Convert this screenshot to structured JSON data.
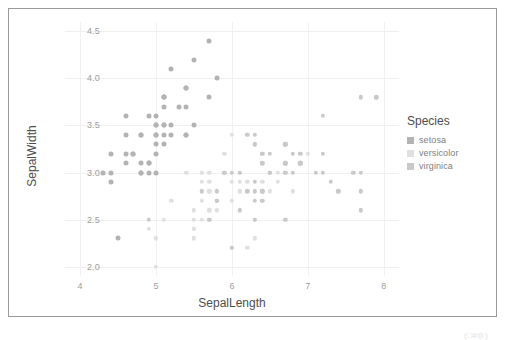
{
  "chart_data": {
    "type": "scatter",
    "title": "",
    "xlabel": "SepalLength",
    "ylabel": "SepalWidth",
    "xlim": [
      3.8,
      8.2
    ],
    "ylim": [
      1.9,
      4.6
    ],
    "xticks": [
      "4",
      "5",
      "6",
      "7",
      "8"
    ],
    "xtick_values": [
      4,
      5,
      6,
      7,
      8
    ],
    "yticks": [
      "2.0",
      "2.5",
      "3.0",
      "3.5",
      "4.0",
      "4.5"
    ],
    "ytick_values": [
      2.0,
      2.5,
      3.0,
      3.5,
      4.0,
      4.5
    ],
    "grid": true,
    "legend_position": "right",
    "legend_title": "Species",
    "series": [
      {
        "name": "setosa",
        "color": "#b3b3b3",
        "marker_size": 5.0,
        "points": [
          [
            5.1,
            3.5
          ],
          [
            4.9,
            3.0
          ],
          [
            4.7,
            3.2
          ],
          [
            4.6,
            3.1
          ],
          [
            5.0,
            3.6
          ],
          [
            5.4,
            3.9
          ],
          [
            4.6,
            3.4
          ],
          [
            5.0,
            3.4
          ],
          [
            4.4,
            2.9
          ],
          [
            4.9,
            3.1
          ],
          [
            5.4,
            3.7
          ],
          [
            4.8,
            3.4
          ],
          [
            4.8,
            3.0
          ],
          [
            4.3,
            3.0
          ],
          [
            5.8,
            4.0
          ],
          [
            5.7,
            4.4
          ],
          [
            5.4,
            3.9
          ],
          [
            5.1,
            3.5
          ],
          [
            5.7,
            3.8
          ],
          [
            5.1,
            3.8
          ],
          [
            5.4,
            3.4
          ],
          [
            5.1,
            3.7
          ],
          [
            4.6,
            3.6
          ],
          [
            5.1,
            3.3
          ],
          [
            4.8,
            3.4
          ],
          [
            5.0,
            3.0
          ],
          [
            5.0,
            3.4
          ],
          [
            5.2,
            3.5
          ],
          [
            5.2,
            3.4
          ],
          [
            4.7,
            3.2
          ],
          [
            4.8,
            3.1
          ],
          [
            5.4,
            3.4
          ],
          [
            5.2,
            4.1
          ],
          [
            5.5,
            4.2
          ],
          [
            4.9,
            3.1
          ],
          [
            5.0,
            3.2
          ],
          [
            5.5,
            3.5
          ],
          [
            4.9,
            3.6
          ],
          [
            4.4,
            3.0
          ],
          [
            5.1,
            3.4
          ],
          [
            5.0,
            3.5
          ],
          [
            4.5,
            2.3
          ],
          [
            4.4,
            3.2
          ],
          [
            5.0,
            3.5
          ],
          [
            5.1,
            3.8
          ],
          [
            4.8,
            3.0
          ],
          [
            5.1,
            3.8
          ],
          [
            4.6,
            3.2
          ],
          [
            5.3,
            3.7
          ],
          [
            5.0,
            3.3
          ]
        ]
      },
      {
        "name": "versicolor",
        "color": "#e0e0e0",
        "marker_size": 4.4,
        "points": [
          [
            7.0,
            3.2
          ],
          [
            6.4,
            3.2
          ],
          [
            6.9,
            3.1
          ],
          [
            5.5,
            2.3
          ],
          [
            6.5,
            2.8
          ],
          [
            5.7,
            2.8
          ],
          [
            6.3,
            3.3
          ],
          [
            4.9,
            2.4
          ],
          [
            6.6,
            2.9
          ],
          [
            5.2,
            2.7
          ],
          [
            5.0,
            2.0
          ],
          [
            5.9,
            3.0
          ],
          [
            6.0,
            2.2
          ],
          [
            6.1,
            2.9
          ],
          [
            5.6,
            2.9
          ],
          [
            6.7,
            3.1
          ],
          [
            5.6,
            3.0
          ],
          [
            5.8,
            2.7
          ],
          [
            6.2,
            2.2
          ],
          [
            5.6,
            2.5
          ],
          [
            5.9,
            3.2
          ],
          [
            6.1,
            2.8
          ],
          [
            6.3,
            2.5
          ],
          [
            6.1,
            2.8
          ],
          [
            6.4,
            2.9
          ],
          [
            6.6,
            3.0
          ],
          [
            6.8,
            2.8
          ],
          [
            6.7,
            3.0
          ],
          [
            6.0,
            2.9
          ],
          [
            5.7,
            2.6
          ],
          [
            5.5,
            2.4
          ],
          [
            5.5,
            2.4
          ],
          [
            5.8,
            2.7
          ],
          [
            6.0,
            2.7
          ],
          [
            5.4,
            3.0
          ],
          [
            6.0,
            3.4
          ],
          [
            6.7,
            3.1
          ],
          [
            6.3,
            2.3
          ],
          [
            5.6,
            3.0
          ],
          [
            5.5,
            2.5
          ],
          [
            5.5,
            2.6
          ],
          [
            6.1,
            3.0
          ],
          [
            5.8,
            2.6
          ],
          [
            5.0,
            2.3
          ],
          [
            5.6,
            2.7
          ],
          [
            5.7,
            3.0
          ],
          [
            5.7,
            2.9
          ],
          [
            6.2,
            2.9
          ],
          [
            5.1,
            2.5
          ],
          [
            5.7,
            2.8
          ]
        ]
      },
      {
        "name": "virginica",
        "color": "#c9c9c9",
        "marker_size": 4.4,
        "points": [
          [
            6.3,
            3.3
          ],
          [
            5.8,
            2.7
          ],
          [
            7.1,
            3.0
          ],
          [
            6.3,
            2.9
          ],
          [
            6.5,
            3.0
          ],
          [
            7.6,
            3.0
          ],
          [
            4.9,
            2.5
          ],
          [
            7.3,
            2.9
          ],
          [
            6.7,
            2.5
          ],
          [
            7.2,
            3.6
          ],
          [
            6.5,
            3.2
          ],
          [
            6.4,
            2.7
          ],
          [
            6.8,
            3.0
          ],
          [
            5.7,
            2.5
          ],
          [
            5.8,
            2.8
          ],
          [
            6.4,
            3.2
          ],
          [
            6.5,
            3.0
          ],
          [
            7.7,
            3.8
          ],
          [
            7.7,
            2.6
          ],
          [
            6.0,
            2.2
          ],
          [
            6.9,
            3.2
          ],
          [
            5.6,
            2.8
          ],
          [
            7.7,
            2.8
          ],
          [
            6.3,
            2.7
          ],
          [
            6.7,
            3.3
          ],
          [
            7.2,
            3.2
          ],
          [
            6.2,
            2.8
          ],
          [
            6.1,
            3.0
          ],
          [
            6.4,
            2.8
          ],
          [
            7.2,
            3.0
          ],
          [
            7.4,
            2.8
          ],
          [
            7.9,
            3.8
          ],
          [
            6.4,
            2.8
          ],
          [
            6.3,
            2.8
          ],
          [
            6.1,
            2.6
          ],
          [
            7.7,
            3.0
          ],
          [
            6.3,
            3.4
          ],
          [
            6.4,
            3.1
          ],
          [
            6.0,
            3.0
          ],
          [
            6.9,
            3.1
          ],
          [
            6.7,
            3.1
          ],
          [
            6.9,
            3.1
          ],
          [
            5.8,
            2.7
          ],
          [
            6.8,
            3.2
          ],
          [
            6.7,
            3.3
          ],
          [
            6.7,
            3.0
          ],
          [
            6.3,
            2.5
          ],
          [
            6.5,
            3.0
          ],
          [
            6.2,
            3.4
          ],
          [
            5.9,
            3.0
          ]
        ]
      }
    ]
  },
  "legend": {
    "title": "Species",
    "items": [
      {
        "label": "setosa",
        "color": "#b3b3b3"
      },
      {
        "label": "versicolor",
        "color": "#e0e0e0"
      },
      {
        "label": "virginica",
        "color": "#c9c9c9"
      }
    ]
  },
  "artifact": {
    "text": "(□#◎)"
  }
}
